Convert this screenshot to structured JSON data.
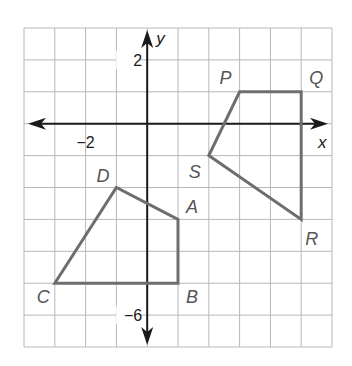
{
  "diagram": {
    "type": "coordinate-plane",
    "x_range": [
      -4,
      6
    ],
    "y_range": [
      -7,
      3
    ],
    "axes": {
      "x_label": "x",
      "y_label": "y"
    },
    "tick_labels": [
      {
        "axis": "x",
        "value": -2,
        "text": "−2"
      },
      {
        "axis": "y",
        "value": 2,
        "text": "2"
      },
      {
        "axis": "y",
        "value": -6,
        "text": "−6"
      }
    ],
    "colors": {
      "grid": "#b8b8b8",
      "axes": "#1a1a1a",
      "shapes": "#6e6e6e",
      "vertex_labels": "#555555"
    },
    "shapes": [
      {
        "name": "ABCD",
        "vertices": [
          {
            "label": "A",
            "x": 1,
            "y": -3
          },
          {
            "label": "B",
            "x": 1,
            "y": -5
          },
          {
            "label": "C",
            "x": -3,
            "y": -5
          },
          {
            "label": "D",
            "x": -1,
            "y": -2
          }
        ]
      },
      {
        "name": "PQRS",
        "vertices": [
          {
            "label": "P",
            "x": 3,
            "y": 1
          },
          {
            "label": "Q",
            "x": 5,
            "y": 1
          },
          {
            "label": "R",
            "x": 5,
            "y": -3
          },
          {
            "label": "S",
            "x": 2,
            "y": -1
          }
        ]
      }
    ]
  }
}
